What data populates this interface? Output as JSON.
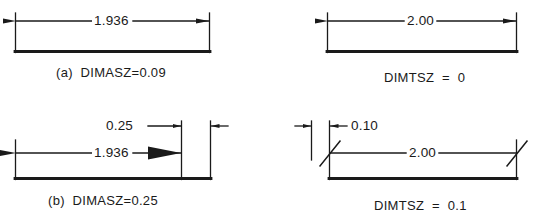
{
  "document": {
    "title": "AutoCAD dimension arrowhead and tick size comparison",
    "background_color": "#ffffff",
    "line_color": "#1a1a1a"
  },
  "figures": [
    {
      "id": "fig-a",
      "position": "top-left",
      "dimension_text": "1.936",
      "terminator_style": "closed-filled-arrow",
      "terminator_size": "small",
      "caption_label": "(a)",
      "caption_variable": "DIMASZ=0.09",
      "caption_full": "(a)  DIMASZ=0.09"
    },
    {
      "id": "fig-c",
      "position": "top-right",
      "dimension_text": "2.00",
      "terminator_style": "closed-filled-arrow",
      "terminator_size": "small",
      "caption_label": "",
      "caption_variable": "DIMTSZ  =  0",
      "caption_full": "DIMTSZ  =  0"
    },
    {
      "id": "fig-b",
      "position": "bottom-left",
      "dimension_text": "1.936",
      "terminator_style": "closed-filled-arrow",
      "terminator_size": "large",
      "annotation_text": "0.25",
      "annotation_meaning": "arrowhead length",
      "caption_label": "(b)",
      "caption_variable": "DIMASZ=0.25",
      "caption_full": "(b)  DIMASZ=0.25"
    },
    {
      "id": "fig-d",
      "position": "bottom-right",
      "dimension_text": "2.00",
      "terminator_style": "oblique-tick",
      "terminator_size": "0.1",
      "annotation_text": "0.10",
      "annotation_meaning": "tick half-length",
      "caption_label": "",
      "caption_variable": "DIMTSZ  =  0.1",
      "caption_full": "DIMTSZ  =  0.1"
    }
  ]
}
